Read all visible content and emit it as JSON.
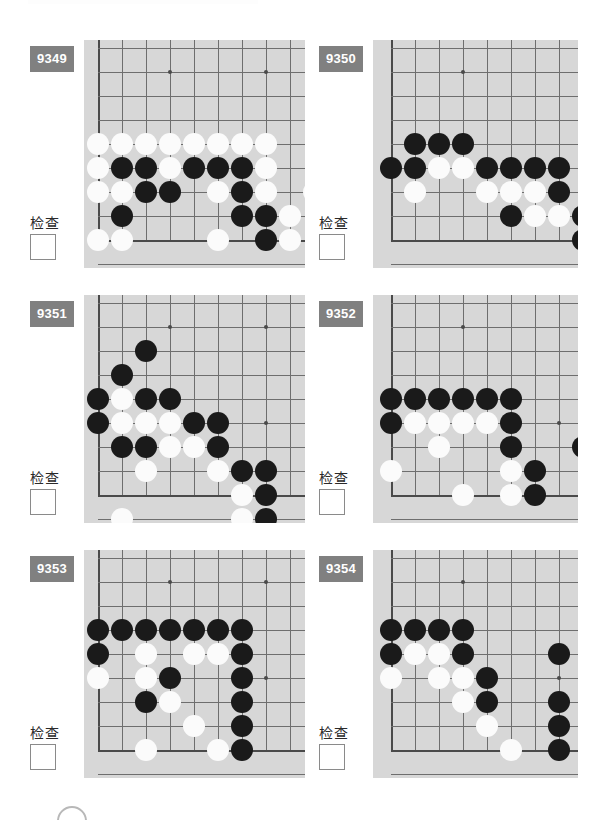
{
  "page": {
    "background_color": "#ffffff",
    "board_color": "#d7d7d7",
    "badge_color": "#808080",
    "grid_color": "#6e6e6e",
    "black_color": "#1a1a1a",
    "white_color": "#fbfbfb",
    "columns": 2,
    "rows": 3
  },
  "labels": {
    "check": "检查"
  },
  "geometry": {
    "cell": 24,
    "stone_radius": 11,
    "cols": 9,
    "rows": 9
  },
  "problems": [
    {
      "id": "9349",
      "number": "9349",
      "check_label": "检查",
      "corner": "bottom-left",
      "board": {
        "left": 84,
        "top": 40,
        "width": 221,
        "height": 228,
        "origin_x": 14,
        "origin_y": 8,
        "edge_left_col": 0,
        "edge_bottom_row": 8,
        "stars": [
          [
            3,
            1
          ],
          [
            7,
            1
          ],
          [
            7,
            5
          ]
        ]
      },
      "stones": [
        {
          "c": 0,
          "r": 4,
          "color": "w"
        },
        {
          "c": 1,
          "r": 4,
          "color": "w"
        },
        {
          "c": 2,
          "r": 4,
          "color": "w"
        },
        {
          "c": 3,
          "r": 4,
          "color": "w"
        },
        {
          "c": 4,
          "r": 4,
          "color": "w"
        },
        {
          "c": 5,
          "r": 4,
          "color": "w"
        },
        {
          "c": 6,
          "r": 4,
          "color": "w"
        },
        {
          "c": 7,
          "r": 4,
          "color": "w"
        },
        {
          "c": 0,
          "r": 5,
          "color": "w"
        },
        {
          "c": 1,
          "r": 5,
          "color": "b"
        },
        {
          "c": 2,
          "r": 5,
          "color": "b"
        },
        {
          "c": 3,
          "r": 5,
          "color": "w"
        },
        {
          "c": 4,
          "r": 5,
          "color": "b"
        },
        {
          "c": 5,
          "r": 5,
          "color": "b"
        },
        {
          "c": 6,
          "r": 5,
          "color": "b"
        },
        {
          "c": 7,
          "r": 5,
          "color": "w"
        },
        {
          "c": 0,
          "r": 6,
          "color": "w"
        },
        {
          "c": 1,
          "r": 6,
          "color": "w"
        },
        {
          "c": 2,
          "r": 6,
          "color": "b"
        },
        {
          "c": 3,
          "r": 6,
          "color": "b"
        },
        {
          "c": 5,
          "r": 6,
          "color": "w"
        },
        {
          "c": 6,
          "r": 6,
          "color": "b"
        },
        {
          "c": 7,
          "r": 6,
          "color": "w"
        },
        {
          "c": 9,
          "r": 6,
          "color": "w"
        },
        {
          "c": 1,
          "r": 7,
          "color": "b"
        },
        {
          "c": 6,
          "r": 7,
          "color": "b"
        },
        {
          "c": 7,
          "r": 7,
          "color": "b"
        },
        {
          "c": 8,
          "r": 7,
          "color": "w"
        },
        {
          "c": 0,
          "r": 8,
          "color": "w"
        },
        {
          "c": 1,
          "r": 8,
          "color": "w"
        },
        {
          "c": 5,
          "r": 8,
          "color": "w"
        },
        {
          "c": 7,
          "r": 8,
          "color": "b"
        },
        {
          "c": 8,
          "r": 8,
          "color": "w"
        }
      ]
    },
    {
      "id": "9350",
      "number": "9350",
      "check_label": "检查",
      "corner": "bottom-left",
      "board": {
        "left": 373,
        "top": 40,
        "width": 205,
        "height": 228,
        "origin_x": 18,
        "origin_y": 8,
        "edge_left_col": 0,
        "edge_bottom_row": 8,
        "stars": [
          [
            3,
            1
          ],
          [
            7,
            5
          ]
        ]
      },
      "stones": [
        {
          "c": 1,
          "r": 4,
          "color": "b"
        },
        {
          "c": 2,
          "r": 4,
          "color": "b"
        },
        {
          "c": 3,
          "r": 4,
          "color": "b"
        },
        {
          "c": 0,
          "r": 5,
          "color": "b"
        },
        {
          "c": 1,
          "r": 5,
          "color": "b"
        },
        {
          "c": 2,
          "r": 5,
          "color": "w"
        },
        {
          "c": 3,
          "r": 5,
          "color": "w"
        },
        {
          "c": 4,
          "r": 5,
          "color": "b"
        },
        {
          "c": 5,
          "r": 5,
          "color": "b"
        },
        {
          "c": 6,
          "r": 5,
          "color": "b"
        },
        {
          "c": 7,
          "r": 5,
          "color": "b"
        },
        {
          "c": 1,
          "r": 6,
          "color": "w"
        },
        {
          "c": 4,
          "r": 6,
          "color": "w"
        },
        {
          "c": 5,
          "r": 6,
          "color": "w"
        },
        {
          "c": 6,
          "r": 6,
          "color": "w"
        },
        {
          "c": 7,
          "r": 6,
          "color": "b"
        },
        {
          "c": 5,
          "r": 7,
          "color": "b"
        },
        {
          "c": 6,
          "r": 7,
          "color": "w"
        },
        {
          "c": 7,
          "r": 7,
          "color": "w"
        },
        {
          "c": 8,
          "r": 7,
          "color": "b"
        },
        {
          "c": 8,
          "r": 8,
          "color": "b"
        }
      ]
    },
    {
      "id": "9351",
      "number": "9351",
      "check_label": "检查",
      "corner": "bottom-left",
      "board": {
        "left": 84,
        "top": 295,
        "width": 221,
        "height": 228,
        "origin_x": 14,
        "origin_y": 8,
        "edge_left_col": 0,
        "edge_bottom_row": 8,
        "stars": [
          [
            3,
            1
          ],
          [
            7,
            1
          ],
          [
            7,
            5
          ]
        ]
      },
      "stones": [
        {
          "c": 2,
          "r": 2,
          "color": "b"
        },
        {
          "c": 1,
          "r": 3,
          "color": "b"
        },
        {
          "c": 0,
          "r": 4,
          "color": "b"
        },
        {
          "c": 1,
          "r": 4,
          "color": "w"
        },
        {
          "c": 2,
          "r": 4,
          "color": "b"
        },
        {
          "c": 3,
          "r": 4,
          "color": "b"
        },
        {
          "c": 0,
          "r": 5,
          "color": "b"
        },
        {
          "c": 1,
          "r": 5,
          "color": "w"
        },
        {
          "c": 2,
          "r": 5,
          "color": "w"
        },
        {
          "c": 3,
          "r": 5,
          "color": "w"
        },
        {
          "c": 4,
          "r": 5,
          "color": "b"
        },
        {
          "c": 5,
          "r": 5,
          "color": "b"
        },
        {
          "c": 1,
          "r": 6,
          "color": "b"
        },
        {
          "c": 2,
          "r": 6,
          "color": "b"
        },
        {
          "c": 3,
          "r": 6,
          "color": "w"
        },
        {
          "c": 4,
          "r": 6,
          "color": "w"
        },
        {
          "c": 5,
          "r": 6,
          "color": "b"
        },
        {
          "c": 2,
          "r": 7,
          "color": "w"
        },
        {
          "c": 5,
          "r": 7,
          "color": "w"
        },
        {
          "c": 6,
          "r": 7,
          "color": "b"
        },
        {
          "c": 7,
          "r": 7,
          "color": "b"
        },
        {
          "c": 6,
          "r": 8,
          "color": "w"
        },
        {
          "c": 7,
          "r": 8,
          "color": "b"
        },
        {
          "c": 1,
          "r": 9,
          "color": "w"
        },
        {
          "c": 6,
          "r": 9,
          "color": "w"
        },
        {
          "c": 7,
          "r": 9,
          "color": "b"
        }
      ]
    },
    {
      "id": "9352",
      "number": "9352",
      "check_label": "检查",
      "corner": "bottom-left",
      "board": {
        "left": 373,
        "top": 295,
        "width": 205,
        "height": 228,
        "origin_x": 18,
        "origin_y": 8,
        "edge_left_col": 0,
        "edge_bottom_row": 8,
        "stars": [
          [
            3,
            1
          ],
          [
            7,
            5
          ]
        ]
      },
      "stones": [
        {
          "c": 0,
          "r": 4,
          "color": "b"
        },
        {
          "c": 1,
          "r": 4,
          "color": "b"
        },
        {
          "c": 2,
          "r": 4,
          "color": "b"
        },
        {
          "c": 3,
          "r": 4,
          "color": "b"
        },
        {
          "c": 4,
          "r": 4,
          "color": "b"
        },
        {
          "c": 5,
          "r": 4,
          "color": "b"
        },
        {
          "c": 0,
          "r": 5,
          "color": "b"
        },
        {
          "c": 1,
          "r": 5,
          "color": "w"
        },
        {
          "c": 2,
          "r": 5,
          "color": "w"
        },
        {
          "c": 3,
          "r": 5,
          "color": "w"
        },
        {
          "c": 4,
          "r": 5,
          "color": "w"
        },
        {
          "c": 5,
          "r": 5,
          "color": "b"
        },
        {
          "c": 2,
          "r": 6,
          "color": "w"
        },
        {
          "c": 5,
          "r": 6,
          "color": "b"
        },
        {
          "c": 8,
          "r": 6,
          "color": "b"
        },
        {
          "c": 0,
          "r": 7,
          "color": "w"
        },
        {
          "c": 5,
          "r": 7,
          "color": "w"
        },
        {
          "c": 6,
          "r": 7,
          "color": "b"
        },
        {
          "c": 3,
          "r": 8,
          "color": "w"
        },
        {
          "c": 5,
          "r": 8,
          "color": "w"
        },
        {
          "c": 6,
          "r": 8,
          "color": "b"
        }
      ]
    },
    {
      "id": "9353",
      "number": "9353",
      "check_label": "检查",
      "corner": "bottom-left",
      "board": {
        "left": 84,
        "top": 550,
        "width": 221,
        "height": 228,
        "origin_x": 14,
        "origin_y": 8,
        "edge_left_col": 0,
        "edge_bottom_row": 8,
        "stars": [
          [
            3,
            1
          ],
          [
            7,
            1
          ],
          [
            7,
            5
          ]
        ]
      },
      "stones": [
        {
          "c": 0,
          "r": 3,
          "color": "b"
        },
        {
          "c": 1,
          "r": 3,
          "color": "b"
        },
        {
          "c": 2,
          "r": 3,
          "color": "b"
        },
        {
          "c": 3,
          "r": 3,
          "color": "b"
        },
        {
          "c": 4,
          "r": 3,
          "color": "b"
        },
        {
          "c": 5,
          "r": 3,
          "color": "b"
        },
        {
          "c": 6,
          "r": 3,
          "color": "b"
        },
        {
          "c": 0,
          "r": 4,
          "color": "b"
        },
        {
          "c": 2,
          "r": 4,
          "color": "w"
        },
        {
          "c": 4,
          "r": 4,
          "color": "w"
        },
        {
          "c": 5,
          "r": 4,
          "color": "w"
        },
        {
          "c": 6,
          "r": 4,
          "color": "b"
        },
        {
          "c": 0,
          "r": 5,
          "color": "w"
        },
        {
          "c": 2,
          "r": 5,
          "color": "w"
        },
        {
          "c": 3,
          "r": 5,
          "color": "b"
        },
        {
          "c": 6,
          "r": 5,
          "color": "b"
        },
        {
          "c": 2,
          "r": 6,
          "color": "b"
        },
        {
          "c": 3,
          "r": 6,
          "color": "w"
        },
        {
          "c": 6,
          "r": 6,
          "color": "b"
        },
        {
          "c": 4,
          "r": 7,
          "color": "w"
        },
        {
          "c": 6,
          "r": 7,
          "color": "b"
        },
        {
          "c": 2,
          "r": 8,
          "color": "w"
        },
        {
          "c": 5,
          "r": 8,
          "color": "w"
        },
        {
          "c": 6,
          "r": 8,
          "color": "b"
        }
      ]
    },
    {
      "id": "9354",
      "number": "9354",
      "check_label": "检查",
      "corner": "bottom-left",
      "board": {
        "left": 373,
        "top": 550,
        "width": 205,
        "height": 228,
        "origin_x": 18,
        "origin_y": 8,
        "edge_left_col": 0,
        "edge_bottom_row": 8,
        "stars": [
          [
            3,
            1
          ],
          [
            7,
            5
          ]
        ]
      },
      "stones": [
        {
          "c": 0,
          "r": 3,
          "color": "b"
        },
        {
          "c": 1,
          "r": 3,
          "color": "b"
        },
        {
          "c": 2,
          "r": 3,
          "color": "b"
        },
        {
          "c": 3,
          "r": 3,
          "color": "b"
        },
        {
          "c": 0,
          "r": 4,
          "color": "b"
        },
        {
          "c": 1,
          "r": 4,
          "color": "w"
        },
        {
          "c": 2,
          "r": 4,
          "color": "w"
        },
        {
          "c": 3,
          "r": 4,
          "color": "b"
        },
        {
          "c": 7,
          "r": 4,
          "color": "b"
        },
        {
          "c": 0,
          "r": 5,
          "color": "w"
        },
        {
          "c": 2,
          "r": 5,
          "color": "w"
        },
        {
          "c": 3,
          "r": 5,
          "color": "w"
        },
        {
          "c": 4,
          "r": 5,
          "color": "b"
        },
        {
          "c": 3,
          "r": 6,
          "color": "w"
        },
        {
          "c": 4,
          "r": 6,
          "color": "b"
        },
        {
          "c": 7,
          "r": 6,
          "color": "b"
        },
        {
          "c": 4,
          "r": 7,
          "color": "w"
        },
        {
          "c": 7,
          "r": 7,
          "color": "b"
        },
        {
          "c": 5,
          "r": 8,
          "color": "w"
        },
        {
          "c": 7,
          "r": 8,
          "color": "b"
        }
      ]
    }
  ]
}
